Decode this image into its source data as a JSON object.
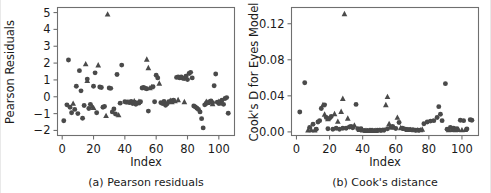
{
  "figure": {
    "background": "#ffffff",
    "marker_color": "#4a4a4a",
    "axis_color": "#6f6f6f",
    "panels": [
      "a",
      "b"
    ]
  },
  "panel_a": {
    "caption": "(a) Pearson residuals",
    "xlabel": "Index",
    "ylabel": "Pearson Residuals",
    "xticks": [
      "0",
      "20",
      "40",
      "60",
      "80",
      "100"
    ],
    "yticks": [
      "5",
      "4",
      "3",
      "2",
      "1",
      "0",
      "−1",
      "−2"
    ]
  },
  "panel_b": {
    "caption": "(b) Cook's distance",
    "xlabel": "Index",
    "ylabel": "Cook's D for Eyes Model",
    "xticks": [
      "0",
      "20",
      "40",
      "60",
      "80",
      "100"
    ],
    "yticks": [
      "0.12",
      "0.08",
      "0.04",
      "0.00"
    ]
  },
  "chart_data": [
    {
      "type": "scatter",
      "title": "(a) Pearson residuals",
      "xlabel": "Index",
      "ylabel": "Pearson Residuals",
      "xlim": [
        -3,
        110
      ],
      "ylim": [
        -2.3,
        5.3
      ],
      "xticks": [
        0,
        20,
        40,
        60,
        80,
        100
      ],
      "yticks": [
        -2,
        -1,
        0,
        1,
        2,
        3,
        4,
        5
      ],
      "grid": false,
      "legend": null,
      "series": [
        {
          "name": "circle-markers",
          "marker": "circle",
          "color": "#4a4a4a",
          "points": [
            [
              1,
              -1.42
            ],
            [
              3,
              -0.48
            ],
            [
              4,
              2.18
            ],
            [
              5,
              -0.62
            ],
            [
              6,
              -0.95
            ],
            [
              8,
              -0.75
            ],
            [
              9,
              0.62
            ],
            [
              10,
              -1.0
            ],
            [
              11,
              1.55
            ],
            [
              12,
              0.35
            ],
            [
              13,
              -1.28
            ],
            [
              14,
              -0.52
            ],
            [
              16,
              1.05
            ],
            [
              17,
              -0.7
            ],
            [
              18,
              -0.45
            ],
            [
              20,
              0.62
            ],
            [
              21,
              1.42
            ],
            [
              22,
              -0.95
            ],
            [
              24,
              0.58
            ],
            [
              25,
              0.55
            ],
            [
              26,
              -0.62
            ],
            [
              27,
              -0.58
            ],
            [
              30,
              0.52
            ],
            [
              31,
              0.5
            ],
            [
              32,
              -0.9
            ],
            [
              33,
              -0.72
            ],
            [
              34,
              -1.02
            ],
            [
              35,
              1.32
            ],
            [
              37,
              -0.38
            ],
            [
              38,
              1.88
            ],
            [
              40,
              -0.3
            ],
            [
              41,
              -0.32
            ],
            [
              43,
              -0.35
            ],
            [
              44,
              -0.28
            ],
            [
              45,
              -0.4
            ],
            [
              46,
              -0.32
            ],
            [
              47,
              -0.45
            ],
            [
              48,
              -0.36
            ],
            [
              49,
              -0.38
            ],
            [
              50,
              -0.3
            ],
            [
              51,
              0.52
            ],
            [
              52,
              0.55
            ],
            [
              53,
              0.5
            ],
            [
              54,
              0.48
            ],
            [
              55,
              -0.85
            ],
            [
              58,
              0.6
            ],
            [
              59,
              -0.3
            ],
            [
              60,
              1.28
            ],
            [
              61,
              1.12
            ],
            [
              63,
              -0.35
            ],
            [
              64,
              -0.4
            ],
            [
              65,
              -0.28
            ],
            [
              66,
              -0.5
            ],
            [
              67,
              -0.42
            ],
            [
              68,
              -0.3
            ],
            [
              70,
              -0.25
            ],
            [
              71,
              -0.2
            ],
            [
              73,
              1.15
            ],
            [
              74,
              1.18
            ],
            [
              75,
              1.12
            ],
            [
              76,
              1.18
            ],
            [
              77,
              1.1
            ],
            [
              78,
              1.08
            ],
            [
              79,
              1.22
            ],
            [
              80,
              1.02
            ],
            [
              81,
              1.38
            ],
            [
              82,
              1.45
            ],
            [
              83,
              1.12
            ],
            [
              84,
              -0.55
            ],
            [
              85,
              -0.6
            ],
            [
              86,
              -0.68
            ],
            [
              87,
              -0.75
            ],
            [
              88,
              -0.9
            ],
            [
              89,
              -1.3
            ],
            [
              90,
              -1.85
            ],
            [
              91,
              -0.48
            ],
            [
              92,
              -0.4
            ],
            [
              94,
              -0.3
            ],
            [
              95,
              -0.25
            ],
            [
              96,
              -0.35
            ],
            [
              97,
              0.65
            ],
            [
              98,
              1.35
            ],
            [
              99,
              -0.32
            ],
            [
              100,
              -0.4
            ],
            [
              101,
              -0.3
            ],
            [
              102,
              -0.2
            ],
            [
              103,
              -0.45
            ],
            [
              104,
              -0.1
            ],
            [
              105,
              -0.05
            ],
            [
              106,
              -0.98
            ]
          ]
        },
        {
          "name": "triangle-markers",
          "marker": "triangle",
          "color": "#4a4a4a",
          "points": [
            [
              7,
              -0.4
            ],
            [
              15,
              1.95
            ],
            [
              16,
              0.95
            ],
            [
              19,
              -0.58
            ],
            [
              20,
              -0.65
            ],
            [
              23,
              1.88
            ],
            [
              28,
              -1.12
            ],
            [
              29,
              4.9
            ],
            [
              36,
              -1.08
            ],
            [
              42,
              -0.3
            ],
            [
              46,
              -0.25
            ],
            [
              47,
              -0.35
            ],
            [
              49,
              -0.28
            ],
            [
              54,
              2.22
            ],
            [
              55,
              1.72
            ],
            [
              56,
              0.52
            ],
            [
              57,
              0.58
            ],
            [
              62,
              0.8
            ],
            [
              69,
              -0.22
            ],
            [
              70,
              -0.3
            ],
            [
              72,
              -0.25
            ],
            [
              74,
              -0.18
            ],
            [
              78,
              -0.3
            ],
            [
              92,
              -0.28
            ],
            [
              93,
              -0.35
            ],
            [
              95,
              -0.3
            ],
            [
              96,
              -0.42
            ],
            [
              100,
              -0.28
            ],
            [
              102,
              -0.38
            ]
          ]
        }
      ]
    },
    {
      "type": "scatter",
      "title": "(b) Cook's distance",
      "xlabel": "Index",
      "ylabel": "Cook's D for Eyes Model",
      "xlim": [
        -3,
        110
      ],
      "ylim": [
        -0.004,
        0.138
      ],
      "xticks": [
        0,
        20,
        40,
        60,
        80,
        100
      ],
      "yticks": [
        0.0,
        0.04,
        0.08,
        0.12
      ],
      "grid": false,
      "legend": null,
      "series": [
        {
          "name": "circle-markers",
          "marker": "circle",
          "color": "#4a4a4a",
          "points": [
            [
              2,
              0.022
            ],
            [
              5,
              0.0545
            ],
            [
              8,
              0.005
            ],
            [
              10,
              0.0085
            ],
            [
              12,
              0.003
            ],
            [
              13,
              0.011
            ],
            [
              14,
              0.0125
            ],
            [
              15,
              0.026
            ],
            [
              17,
              0.03
            ],
            [
              18,
              0.016
            ],
            [
              19,
              0.0035
            ],
            [
              20,
              0.015
            ],
            [
              21,
              0.017
            ],
            [
              22,
              0.003
            ],
            [
              24,
              0.004
            ],
            [
              26,
              0.003
            ],
            [
              28,
              0.004
            ],
            [
              30,
              0.004
            ],
            [
              32,
              0.0055
            ],
            [
              33,
              0.006
            ],
            [
              34,
              0.0045
            ],
            [
              36,
              0.0305
            ],
            [
              37,
              0.0035
            ],
            [
              39,
              0.0035
            ],
            [
              41,
              0.0015
            ],
            [
              43,
              0.0015
            ],
            [
              45,
              0.0018
            ],
            [
              47,
              0.0015
            ],
            [
              49,
              0.0018
            ],
            [
              51,
              0.002
            ],
            [
              53,
              0.0022
            ],
            [
              55,
              0.0035
            ],
            [
              57,
              0.005
            ],
            [
              58,
              0.006
            ],
            [
              60,
              0.0038
            ],
            [
              62,
              0.0105
            ],
            [
              64,
              0.0042
            ],
            [
              66,
              0.003
            ],
            [
              68,
              0.0028
            ],
            [
              70,
              0.0025
            ],
            [
              72,
              0.002
            ],
            [
              74,
              0.002
            ],
            [
              77,
              0.009
            ],
            [
              79,
              0.011
            ],
            [
              81,
              0.012
            ],
            [
              83,
              0.0125
            ],
            [
              85,
              0.016
            ],
            [
              86,
              0.028
            ],
            [
              87,
              0.0195
            ],
            [
              88,
              0.0125
            ],
            [
              90,
              0.0535
            ],
            [
              91,
              0.003
            ],
            [
              93,
              0.0048
            ],
            [
              95,
              0.004
            ],
            [
              97,
              0.0035
            ],
            [
              99,
              0.013
            ],
            [
              101,
              0.0125
            ],
            [
              103,
              0.0032
            ],
            [
              105,
              0.0135
            ],
            [
              106,
              0.013
            ]
          ]
        },
        {
          "name": "triangle-markers",
          "marker": "triangle",
          "color": "#4a4a4a",
          "points": [
            [
              7,
              0.002
            ],
            [
              9,
              0.0022
            ],
            [
              11,
              0.002
            ],
            [
              16,
              0.03
            ],
            [
              17,
              0.0195
            ],
            [
              19,
              0.0145
            ],
            [
              23,
              0.02
            ],
            [
              25,
              0.0115
            ],
            [
              27,
              0.0225
            ],
            [
              28,
              0.037
            ],
            [
              29,
              0.131
            ],
            [
              31,
              0.015
            ],
            [
              35,
              0.0075
            ],
            [
              38,
              0.0025
            ],
            [
              40,
              0.0018
            ],
            [
              42,
              0.0015
            ],
            [
              44,
              0.0015
            ],
            [
              46,
              0.0015
            ],
            [
              48,
              0.0015
            ],
            [
              50,
              0.0018
            ],
            [
              52,
              0.0018
            ],
            [
              54,
              0.03
            ],
            [
              55,
              0.039
            ],
            [
              56,
              0.009
            ],
            [
              59,
              0.005
            ],
            [
              61,
              0.016
            ],
            [
              63,
              0.0045
            ],
            [
              65,
              0.0035
            ],
            [
              67,
              0.0025
            ],
            [
              69,
              0.0025
            ],
            [
              71,
              0.0022
            ],
            [
              73,
              0.002
            ],
            [
              75,
              0.0022
            ],
            [
              76,
              0.0028
            ],
            [
              92,
              0.0022
            ],
            [
              94,
              0.0025
            ],
            [
              96,
              0.0022
            ],
            [
              98,
              0.0025
            ],
            [
              100,
              0.0022
            ],
            [
              102,
              0.0025
            ]
          ]
        }
      ]
    }
  ]
}
